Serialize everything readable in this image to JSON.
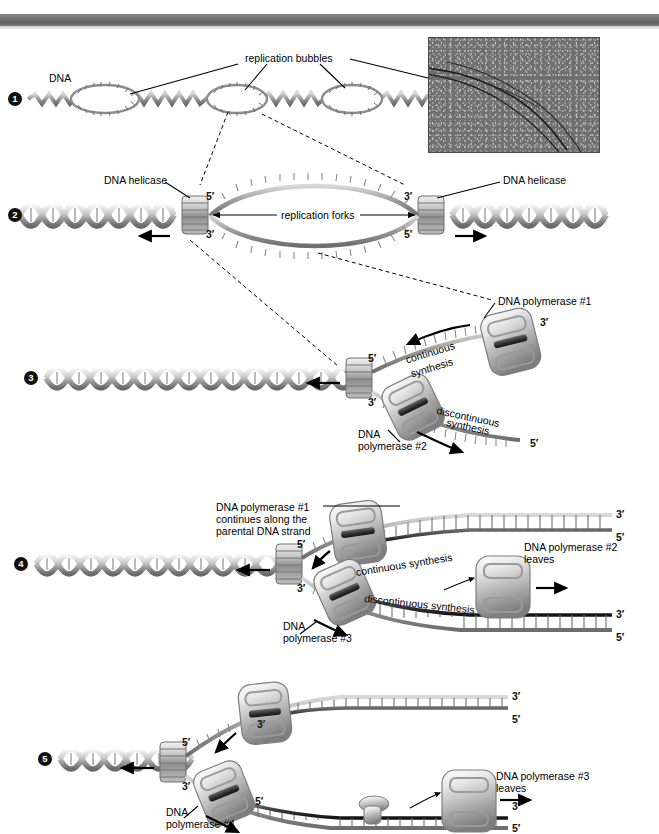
{
  "figure": {
    "background": "#ffffff",
    "rule_color": "#6e6e6e"
  },
  "steps": [
    {
      "marker": "❶",
      "number": "1"
    },
    {
      "marker": "❷",
      "number": "2"
    },
    {
      "marker": "❸",
      "number": "3"
    },
    {
      "marker": "❹",
      "number": "4"
    },
    {
      "marker": "❺",
      "number": "5"
    }
  ],
  "panel1": {
    "dna_label": "DNA",
    "bubbles_label": "replication bubbles",
    "micrograph": {
      "name": "electron-micrograph",
      "caption": ""
    }
  },
  "panel2": {
    "helicase_left": "DNA helicase",
    "helicase_right": "DNA helicase",
    "forks_label": "replication forks",
    "primes": {
      "top_left": "5′",
      "bottom_left": "3′",
      "top_right": "3′",
      "bottom_right": "5′"
    }
  },
  "panel3": {
    "polymerase1": "DNA polymerase #1",
    "polymerase2_line1": "DNA",
    "polymerase2_line2": "polymerase #2",
    "continuous_line1": "continuous",
    "continuous_line2": "synthesis",
    "discontinuous_line1": "discontinuous",
    "discontinuous_line2": "synthesis",
    "primes": {
      "fork_top": "5′",
      "fork_bottom": "3′",
      "leading_end": "3′",
      "lagging_end": "5′"
    }
  },
  "panel4": {
    "polymerase1_line1": "DNA polymerase #1",
    "polymerase1_line2": "continues along the",
    "polymerase1_line3": "parental DNA strand",
    "polymerase3_line1": "DNA",
    "polymerase3_line2": "polymerase #3",
    "polymerase2_line1": "DNA polymerase #2",
    "polymerase2_line2": "leaves",
    "continuous": "continuous synthesis",
    "discontinuous": "discontinuous synthesis",
    "primes": {
      "fork_top": "5′",
      "fork_bottom": "3′",
      "leading_top": "3′",
      "leading_bottom": "5′",
      "lagging_top": "3′",
      "lagging_bottom": "5′"
    }
  },
  "panel5": {
    "polymerase4_line1": "DNA",
    "polymerase4_line2": "polymerase #4",
    "polymerase3_line1": "DNA polymerase #3",
    "polymerase3_line2": "leaves",
    "primes": {
      "fork_top": "5′",
      "fork_bottom": "3′",
      "upper_inner": "3′",
      "upper_end_top": "3′",
      "upper_end_bottom": "5′",
      "lower_start": "5′",
      "lower_end_top": "3′",
      "lower_end_bottom": "5′"
    },
    "ligase_icon": "ligase-protein"
  }
}
